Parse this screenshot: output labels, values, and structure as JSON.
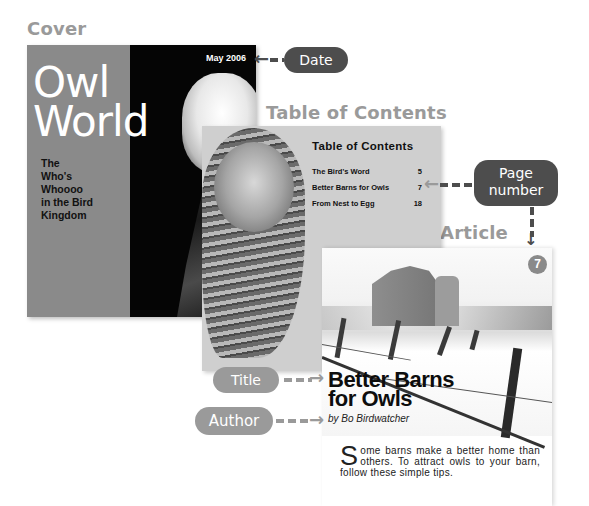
{
  "labels": {
    "cover": "Cover",
    "toc": "Table of Contents",
    "article": "Article"
  },
  "cover": {
    "date": "May 2006",
    "title_line1": "Owl",
    "title_line2": "World",
    "subtitle": [
      "The",
      "Who's",
      "Whoooo",
      "in the Bird",
      "Kingdom"
    ]
  },
  "toc": {
    "heading": "Table of Contents",
    "entries": [
      {
        "title": "The Bird's Word",
        "page": "5"
      },
      {
        "title": "Better Barns for Owls",
        "page": "7"
      },
      {
        "title": "From Nest to Egg",
        "page": "18"
      }
    ]
  },
  "article": {
    "page_number": "7",
    "title_line1": "Better Barns",
    "title_line2": "for Owls",
    "author": "by Bo Birdwatcher",
    "dropcap": "S",
    "body": "ome barns make a better home than others. To attract owls to your barn, follow these simple tips."
  },
  "callouts": {
    "date": "Date",
    "page_number_line1": "Page",
    "page_number_line2": "number",
    "title": "Title",
    "author": "Author"
  },
  "colors": {
    "dark_callout": "#4d4d4d",
    "light_callout": "#9a9a9a",
    "section_label": "#9a9a9a"
  }
}
